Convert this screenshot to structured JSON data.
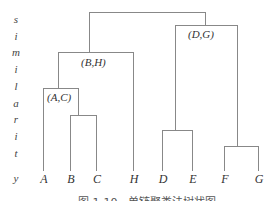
{
  "axis": {
    "label_letters": [
      "s",
      "i",
      "m",
      "i",
      "l",
      "a",
      "r",
      "i",
      "t",
      "y"
    ],
    "label_word": "similarity"
  },
  "leaves": [
    "A",
    "B",
    "C",
    "H",
    "D",
    "E",
    "F",
    "G"
  ],
  "clusters": {
    "a_c": "(A,C)",
    "b_h": "(B,H)",
    "d_g": "(D,G)"
  },
  "caption": "图 1-10　单链聚类法树状图",
  "colors": {
    "line": "#888888",
    "text": "#333333"
  }
}
